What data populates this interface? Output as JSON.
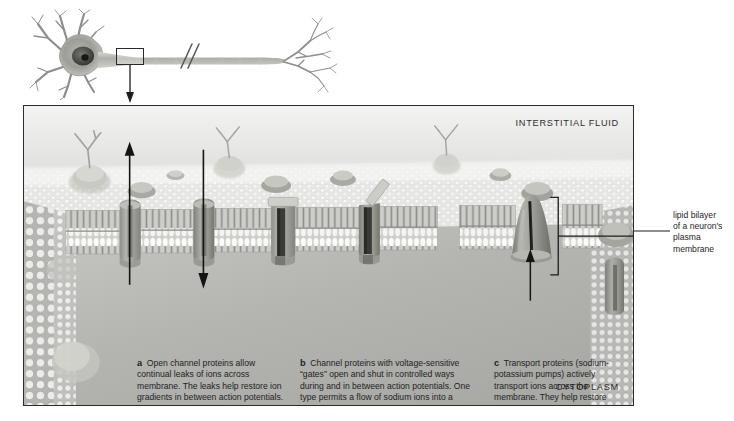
{
  "overview": {
    "name": "neuron-overview",
    "parts": {
      "cell_body": "cell-body-with-dendrites",
      "axon": "axon",
      "axon_break": "//",
      "axon_terminals": "axon-terminal-branches",
      "callout_region": "membrane-detail-callout"
    }
  },
  "panel": {
    "environment_labels": {
      "top": "INTERSTITIAL FLUID",
      "bottom": "CYTOPLASM"
    },
    "captions": [
      {
        "marker": "a",
        "text": "Open channel proteins allow continual leaks of ions across membrane. The leaks help restore ion gradients in between action potentials."
      },
      {
        "marker": "b",
        "text": "Channel proteins with voltage-sensitive “gates” open and shut in controlled ways during and in between action potentials. One type permits a flow of sodium ions into a stimulated neuron; this is the trigger for an action potential. One type permits potassium flow that helps end an action potential."
      },
      {
        "marker": "c",
        "text": "Transport proteins (sodium-potassium pumps) actively transport ions across the membrane. They help restore gradients and counter the leaks in between action potentials."
      }
    ],
    "structures": {
      "open_channel_protein": "open-channel-protein",
      "gated_channel_protein": "voltage-gated-channel-protein",
      "transport_protein": "sodium-potassium-pump",
      "glycoprotein": "glycoprotein-with-sugar-chain",
      "phospholipid_bilayer": "phospholipid-bilayer"
    },
    "flow_arrows": [
      {
        "name": "ion-leak-arrow-outward",
        "direction": "up"
      },
      {
        "name": "ion-leak-arrow-inward",
        "direction": "down"
      },
      {
        "name": "active-transport-arrow",
        "direction": "up"
      }
    ]
  },
  "side_label": {
    "lines": [
      "lipid bilayer",
      "of a neuron's",
      "plasma",
      "membrane"
    ],
    "full_text": "lipid bilayer of a neuron's plasma membrane"
  },
  "colors": {
    "page_background": "#ffffff",
    "panel_border": "#2b2b2b",
    "interstitial_fluid": "#ececeb",
    "cytoplasm": "#b9b9b6",
    "membrane_protein": "#9a9a96",
    "phospholipid_head": "#f2f2f0",
    "text": "#232323",
    "arrow": "#1a1a1a"
  }
}
